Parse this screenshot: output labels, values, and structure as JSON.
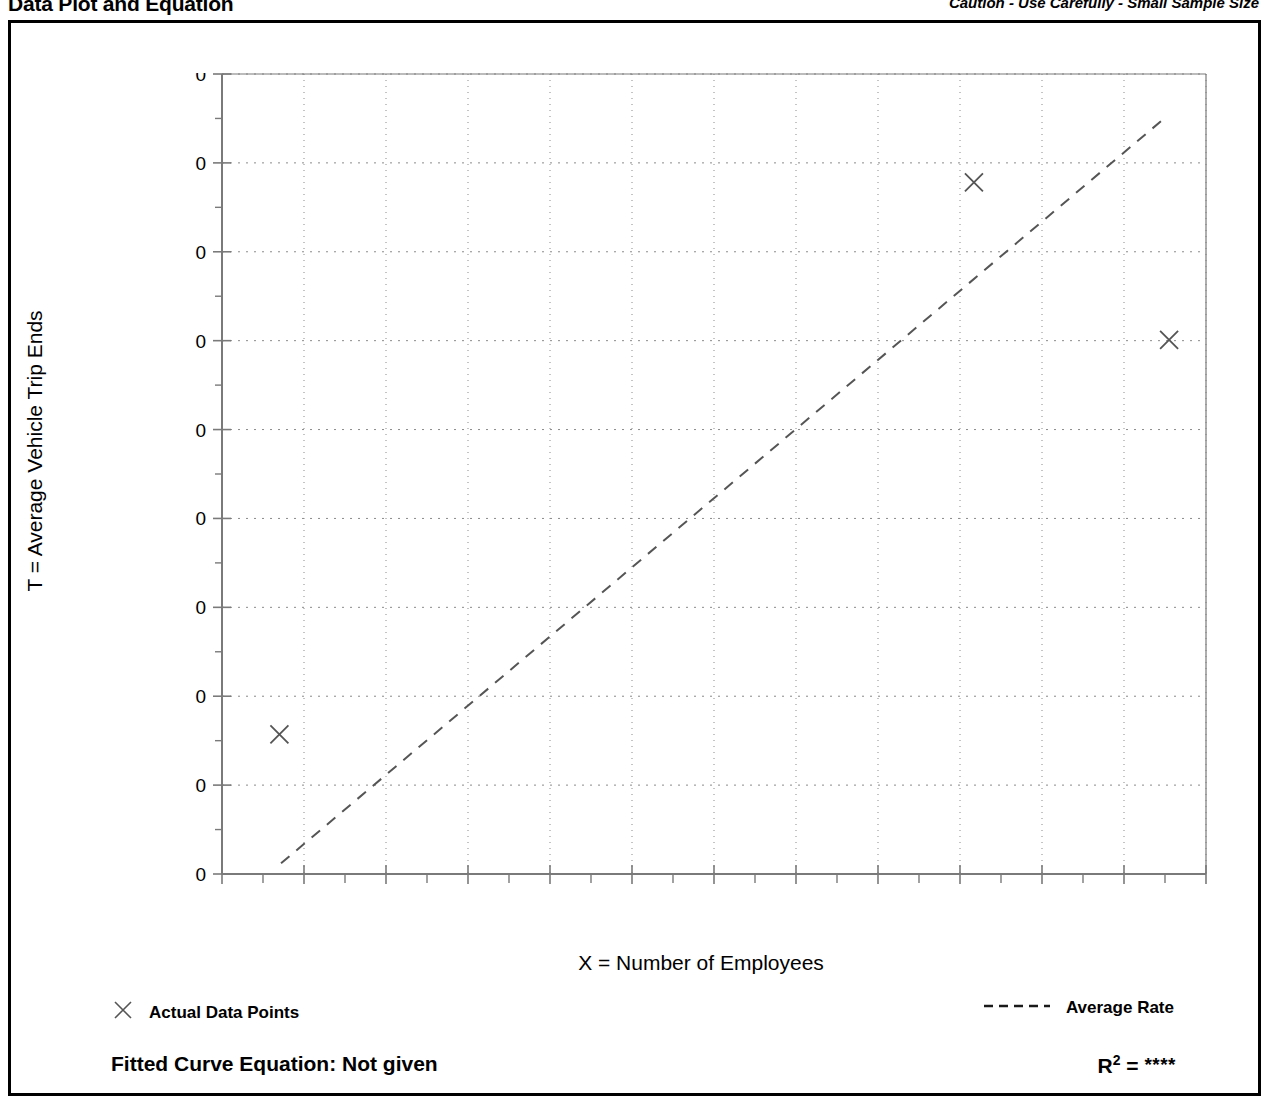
{
  "header": {
    "title": "Data Plot and Equation",
    "caution": "Caution - Use Carefully - Small Sample Size"
  },
  "legend": {
    "points_label": "Actual Data Points",
    "points_marker": "x-marker-icon",
    "line_label": "Average Rate",
    "line_marker": "dashed-line-icon"
  },
  "footer": {
    "equation_label": "Fitted Curve Equation:  Not given",
    "r_squared_label": "R",
    "r_squared_exponent": "2",
    "r_squared_equals": "=",
    "r_squared_value": "****"
  },
  "colors": {
    "frame": "#000000",
    "axis": "#7a7a7a",
    "grid": "#8a8a8a",
    "marker": "#555555",
    "trendline": "#555555",
    "text": "#000000"
  },
  "chart_data": {
    "type": "scatter",
    "title": "Data Plot and Equation",
    "xlabel": "X = Number of Employees",
    "ylabel": "T = Average Vehicle Trip Ends",
    "xlim": [
      200,
      1400
    ],
    "ylim": [
      200,
      1100
    ],
    "xticks": [
      200,
      300,
      400,
      500,
      600,
      700,
      800,
      900,
      1000,
      1100,
      1200,
      1300,
      1400
    ],
    "yticks": [
      200,
      300,
      400,
      500,
      600,
      700,
      800,
      900,
      1000,
      1100
    ],
    "xtick_labels": [
      "200",
      "300",
      "400",
      "500",
      "600",
      "700",
      "800",
      "900",
      "1000",
      "1100",
      "1200",
      "1300",
      "1400"
    ],
    "ytick_labels": [
      "200",
      "300",
      "400",
      "500",
      "600",
      "700",
      "800",
      "900",
      "1,000",
      "1,100"
    ],
    "minor_ticks": true,
    "grid": true,
    "grid_style": "dotted",
    "legend_position": "below-axes",
    "series": [
      {
        "name": "Actual Data Points",
        "type": "scatter",
        "marker": "x",
        "points": [
          {
            "x": 270,
            "y": 357
          },
          {
            "x": 1117,
            "y": 978
          },
          {
            "x": 1355,
            "y": 801
          }
        ]
      },
      {
        "name": "Average Rate",
        "type": "line",
        "style": "dashed",
        "description": "Line through origin representing the average trip rate",
        "endpoints": [
          {
            "x": 272,
            "y": 212
          },
          {
            "x": 1353,
            "y": 1053
          }
        ]
      }
    ],
    "annotations": [
      "Caution - Use Carefully - Small Sample Size",
      "Fitted Curve Equation:  Not given",
      "R2 = ****"
    ]
  }
}
